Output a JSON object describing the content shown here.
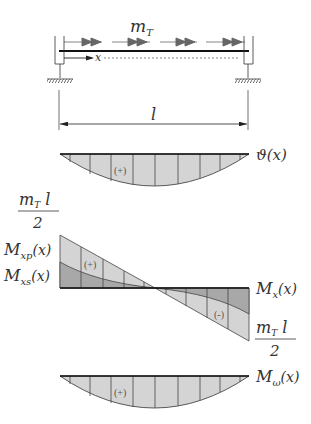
{
  "figure": {
    "beam": {
      "load_label": "m",
      "load_subscript": "T",
      "axis_label": "x",
      "span_label": "l"
    },
    "diagrams": [
      {
        "id": "twist_angle",
        "label": "ϑ(x)",
        "sign": "(+)"
      },
      {
        "id": "torsion_moment",
        "label": "M",
        "label_sub": "x",
        "label_tail": "(x)",
        "primary_label": "M",
        "primary_sub": "xp",
        "primary_tail": "(x)",
        "secondary_label": "M",
        "secondary_sub": "xs",
        "secondary_tail": "(x)",
        "top_value_num": "m",
        "top_value_sub": "T",
        "top_value_l": " l",
        "top_value_den": "2",
        "bottom_value_num": "m",
        "bottom_value_sub": "T",
        "bottom_value_l": " l",
        "bottom_value_den": "2",
        "sign_positive": "(+)",
        "sign_negative": "(-)"
      },
      {
        "id": "bimoment",
        "label": "M",
        "label_sub": "ω",
        "label_tail": "(x)",
        "sign": "(+)"
      }
    ],
    "colors": {
      "fill_light": "#d4d4d4",
      "fill_dark": "#a8a8a8",
      "line": "#222222",
      "arrow": "#666666"
    }
  }
}
